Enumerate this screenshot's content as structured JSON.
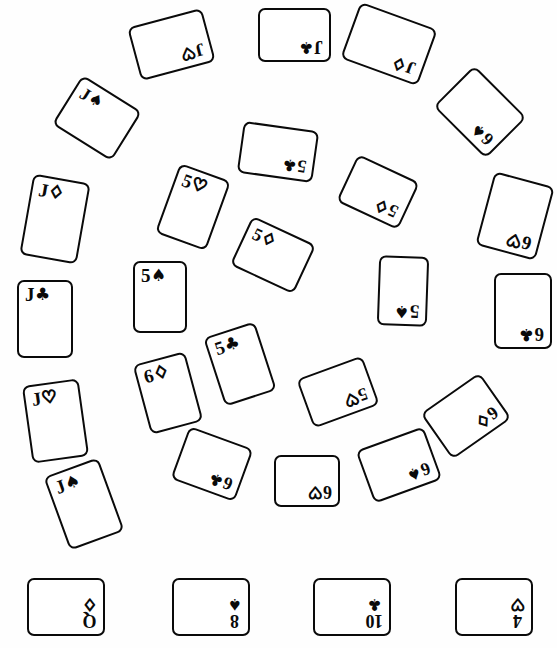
{
  "scene": {
    "title": "Playing cards scattered in concentric rings",
    "background_color": "#fefefe",
    "ink_color": "#0a0a0a",
    "width": 557,
    "height": 648
  },
  "suit_glyphs": {
    "spade": "♠",
    "heart": "♡",
    "diamond": "♢",
    "club": "♣"
  },
  "groups": {
    "outer_ring_label": "outer-ring",
    "inner_ring_label": "inner-ring",
    "bottom_row_label": "bottom-row"
  },
  "cards": [
    {
      "id": "c01",
      "rank": "J",
      "suit": "heart",
      "suit_glyph": "♡",
      "filled": false,
      "x": 133,
      "y": 17,
      "w": 77,
      "h": 55,
      "rot": 165,
      "group": "outer-ring"
    },
    {
      "id": "c02",
      "rank": "J",
      "suit": "club",
      "suit_glyph": "♣",
      "filled": true,
      "x": 258,
      "y": 8,
      "w": 73,
      "h": 54,
      "rot": 180,
      "group": "outer-ring"
    },
    {
      "id": "c03",
      "rank": "J",
      "suit": "diamond",
      "suit_glyph": "♢",
      "filled": false,
      "x": 348,
      "y": 14,
      "w": 82,
      "h": 60,
      "rot": 200,
      "group": "outer-ring"
    },
    {
      "id": "c04",
      "rank": "6",
      "suit": "spade",
      "suit_glyph": "♠",
      "filled": true,
      "x": 443,
      "y": 83,
      "w": 74,
      "h": 58,
      "rot": 225,
      "group": "outer-ring"
    },
    {
      "id": "c05",
      "rank": "6",
      "suit": "heart",
      "suit_glyph": "♡",
      "filled": false,
      "x": 484,
      "y": 178,
      "w": 62,
      "h": 76,
      "rot": 195,
      "group": "outer-ring"
    },
    {
      "id": "c06",
      "rank": "6",
      "suit": "club",
      "suit_glyph": "♣",
      "filled": true,
      "x": 494,
      "y": 273,
      "w": 58,
      "h": 76,
      "rot": 180,
      "group": "outer-ring"
    },
    {
      "id": "c07",
      "rank": "6",
      "suit": "diamond",
      "suit_glyph": "♢",
      "filled": false,
      "x": 430,
      "y": 388,
      "w": 72,
      "h": 56,
      "rot": 145,
      "group": "outer-ring"
    },
    {
      "id": "c08",
      "rank": "6",
      "suit": "spade",
      "suit_glyph": "♠",
      "filled": true,
      "x": 363,
      "y": 437,
      "w": 72,
      "h": 56,
      "rot": 160,
      "group": "outer-ring"
    },
    {
      "id": "c09",
      "rank": "6",
      "suit": "heart",
      "suit_glyph": "♡",
      "filled": false,
      "x": 274,
      "y": 455,
      "w": 66,
      "h": 52,
      "rot": 180,
      "group": "outer-ring"
    },
    {
      "id": "c10",
      "rank": "6",
      "suit": "club",
      "suit_glyph": "♣",
      "filled": true,
      "x": 178,
      "y": 436,
      "w": 68,
      "h": 56,
      "rot": 200,
      "group": "outer-ring"
    },
    {
      "id": "c11",
      "rank": "J",
      "suit": "spade",
      "suit_glyph": "♠",
      "filled": true,
      "x": 55,
      "y": 465,
      "w": 58,
      "h": 78,
      "rot": 340,
      "group": "outer-ring"
    },
    {
      "id": "c12",
      "rank": "J",
      "suit": "heart",
      "suit_glyph": "♡",
      "filled": false,
      "x": 27,
      "y": 382,
      "w": 57,
      "h": 78,
      "rot": 352,
      "group": "outer-ring"
    },
    {
      "id": "c13",
      "rank": "J",
      "suit": "club",
      "suit_glyph": "♣",
      "filled": true,
      "x": 17,
      "y": 280,
      "w": 56,
      "h": 78,
      "rot": 0,
      "group": "outer-ring"
    },
    {
      "id": "c14",
      "rank": "J",
      "suit": "diamond",
      "suit_glyph": "♢",
      "filled": false,
      "x": 26,
      "y": 178,
      "w": 58,
      "h": 82,
      "rot": 10,
      "group": "outer-ring"
    },
    {
      "id": "c15",
      "rank": "J",
      "suit": "spade",
      "suit_glyph": "♠",
      "filled": true,
      "x": 62,
      "y": 89,
      "w": 70,
      "h": 58,
      "rot": 32,
      "group": "outer-ring"
    },
    {
      "id": "c16",
      "rank": "5",
      "suit": "club",
      "suit_glyph": "♣",
      "filled": true,
      "x": 240,
      "y": 126,
      "w": 76,
      "h": 52,
      "rot": 188,
      "group": "inner-ring"
    },
    {
      "id": "c17",
      "rank": "5",
      "suit": "diamond",
      "suit_glyph": "♢",
      "filled": false,
      "x": 344,
      "y": 166,
      "w": 68,
      "h": 52,
      "rot": 205,
      "group": "inner-ring"
    },
    {
      "id": "c18",
      "rank": "5",
      "suit": "spade",
      "suit_glyph": "♠",
      "filled": true,
      "x": 378,
      "y": 256,
      "w": 50,
      "h": 70,
      "rot": 182,
      "group": "inner-ring"
    },
    {
      "id": "c19",
      "rank": "5",
      "suit": "heart",
      "suit_glyph": "♡",
      "filled": false,
      "x": 303,
      "y": 366,
      "w": 70,
      "h": 52,
      "rot": 160,
      "group": "inner-ring"
    },
    {
      "id": "c20",
      "rank": "5",
      "suit": "club",
      "suit_glyph": "♣",
      "filled": true,
      "x": 213,
      "y": 328,
      "w": 54,
      "h": 72,
      "rot": 342,
      "group": "inner-ring"
    },
    {
      "id": "c21",
      "rank": "6",
      "suit": "diamond",
      "suit_glyph": "♢",
      "filled": false,
      "x": 141,
      "y": 357,
      "w": 54,
      "h": 72,
      "rot": 345,
      "group": "inner-ring"
    },
    {
      "id": "c22",
      "rank": "5",
      "suit": "spade",
      "suit_glyph": "♠",
      "filled": true,
      "x": 133,
      "y": 261,
      "w": 54,
      "h": 72,
      "rot": 0,
      "group": "inner-ring"
    },
    {
      "id": "c23",
      "rank": "5",
      "suit": "heart",
      "suit_glyph": "♡",
      "filled": false,
      "x": 166,
      "y": 170,
      "w": 54,
      "h": 74,
      "rot": 20,
      "group": "inner-ring"
    },
    {
      "id": "c24",
      "rank": "5",
      "suit": "diamond",
      "suit_glyph": "♢",
      "filled": false,
      "x": 238,
      "y": 228,
      "w": 70,
      "h": 54,
      "rot": 25,
      "group": "inner-ring"
    },
    {
      "id": "c25",
      "rank": "Q",
      "suit": "diamond",
      "suit_glyph": "♢",
      "filled": false,
      "x": 27,
      "y": 578,
      "w": 78,
      "h": 58,
      "rot": 180,
      "group": "bottom-row"
    },
    {
      "id": "c26",
      "rank": "8",
      "suit": "spade",
      "suit_glyph": "♠",
      "filled": true,
      "x": 172,
      "y": 578,
      "w": 78,
      "h": 58,
      "rot": 180,
      "group": "bottom-row"
    },
    {
      "id": "c27",
      "rank": "10",
      "suit": "club",
      "suit_glyph": "♣",
      "filled": true,
      "x": 313,
      "y": 578,
      "w": 78,
      "h": 58,
      "rot": 180,
      "group": "bottom-row"
    },
    {
      "id": "c28",
      "rank": "4",
      "suit": "heart",
      "suit_glyph": "♡",
      "filled": false,
      "x": 455,
      "y": 578,
      "w": 78,
      "h": 58,
      "rot": 180,
      "group": "bottom-row"
    }
  ]
}
